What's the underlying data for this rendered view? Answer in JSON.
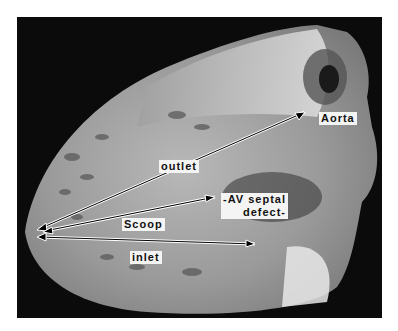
{
  "image": {
    "description": "Grayscale photograph of a sectioned heart specimen with annotated arrows",
    "background_color": "#ffffff",
    "photo_background": "#0b0b0b"
  },
  "labels": {
    "aorta": "Aorta",
    "outlet": "outlet",
    "av_septal_line1": "-AV septal",
    "av_septal_line2": "defect-",
    "scoop": "Scoop",
    "inlet": "inlet"
  }
}
